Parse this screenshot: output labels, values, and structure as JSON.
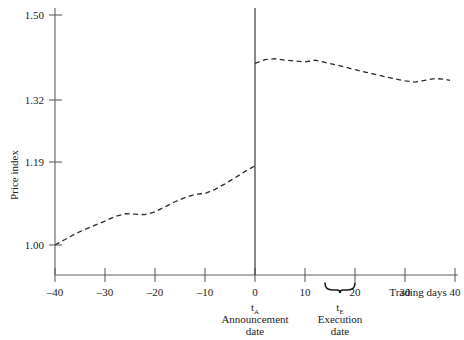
{
  "chart_data": {
    "type": "line",
    "title": "",
    "subtitle": "",
    "xlabel": "Trading days",
    "ylabel": "Price index",
    "xlim": [
      -40,
      40
    ],
    "ylim": [
      0.955,
      1.5
    ],
    "grid": false,
    "legend": "none",
    "line_style": "dashed",
    "xticks": [
      -40,
      -30,
      -20,
      -10,
      0,
      10,
      20,
      30,
      40
    ],
    "xtick_labels": [
      "–40",
      "–30",
      "–20",
      "–10",
      "0",
      "10",
      "20",
      "30",
      "40"
    ],
    "yticks": [
      1.0,
      1.19,
      1.32,
      1.5
    ],
    "ytick_labels": [
      "1.00",
      "1.19",
      "1.32",
      "1.50"
    ],
    "series": [
      {
        "name": "Price index (pre-announcement)",
        "x": [
          -40,
          -38,
          -36,
          -34,
          -32,
          -30,
          -28,
          -26,
          -24,
          -22,
          -20,
          -18,
          -16,
          -14,
          -12,
          -10,
          -8,
          -6,
          -4,
          -2,
          0
        ],
        "values": [
          1.0,
          1.012,
          1.024,
          1.034,
          1.043,
          1.052,
          1.062,
          1.068,
          1.067,
          1.066,
          1.072,
          1.083,
          1.094,
          1.103,
          1.11,
          1.112,
          1.121,
          1.133,
          1.146,
          1.16,
          1.172
        ]
      },
      {
        "name": "Price index (post-announcement)",
        "x": [
          0,
          2,
          4,
          6,
          8,
          10,
          12,
          14,
          16,
          18,
          20,
          22,
          24,
          26,
          28,
          30,
          32,
          34,
          36,
          38,
          39
        ],
        "values": [
          1.395,
          1.403,
          1.405,
          1.402,
          1.4,
          1.398,
          1.402,
          1.397,
          1.392,
          1.387,
          1.381,
          1.376,
          1.371,
          1.366,
          1.361,
          1.357,
          1.354,
          1.358,
          1.362,
          1.36,
          1.358
        ]
      }
    ],
    "annotations": [
      {
        "name": "announcement-date",
        "x": 0,
        "symbol": "t",
        "subscript": "A",
        "line1": "Announcement",
        "line2": "date"
      },
      {
        "name": "execution-date",
        "x": 17,
        "brace_from": 14,
        "brace_to": 20,
        "symbol": "t",
        "subscript": "E",
        "line1": "Execution",
        "line2": "date"
      }
    ],
    "vertical_line_at_x": 0,
    "colors": {
      "line": "#2b2b2b",
      "axis": "#555555",
      "text": "#1a1a1a",
      "background": "#ffffff"
    }
  }
}
